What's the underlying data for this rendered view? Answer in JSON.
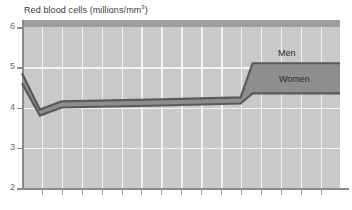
{
  "chart_data": {
    "type": "area",
    "title": "Red blood cells (millions/mm3)",
    "title_main": "Red blood cells (millions/mm",
    "title_sup": "3",
    "title_tail": ")",
    "xlabel": "",
    "ylabel": "",
    "ylim": [
      2,
      6
    ],
    "yticks": [
      6,
      5,
      4,
      3,
      2
    ],
    "ytick_labels": [
      "6",
      "5",
      "4",
      "3",
      "2"
    ],
    "grid": "both",
    "xtick_count": 16,
    "xtick_labels": [],
    "legend_position": "inline-right",
    "annotations": [
      {
        "text": "Men",
        "value": 5.1
      },
      {
        "text": "Women",
        "value": 4.35
      }
    ],
    "series": [
      {
        "name": "Men",
        "role": "upper",
        "x": [
          0,
          0.9,
          2.0,
          7.0,
          11.0,
          11.6,
          16.0
        ],
        "values": [
          4.85,
          3.95,
          4.15,
          4.2,
          4.25,
          5.1,
          5.1
        ]
      },
      {
        "name": "Women",
        "role": "lower",
        "x": [
          0,
          0.9,
          2.0,
          7.0,
          11.0,
          11.6,
          16.0
        ],
        "values": [
          4.6,
          3.8,
          4.0,
          4.05,
          4.1,
          4.35,
          4.35
        ]
      }
    ],
    "colors": {
      "plot_background": "#c9c9c9",
      "gridlines": "#f2f2f2",
      "band_fill": "#8e8e8e",
      "band_edge": "#5a5a5a",
      "axis": "#8a8a8a",
      "text": "#3a3a3a"
    }
  }
}
